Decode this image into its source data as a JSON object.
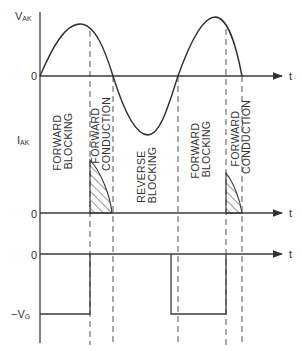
{
  "figure": {
    "panels": [
      {
        "id": "anode-cathode-voltage",
        "y_label_main": "V",
        "y_label_sub": "AK",
        "zero_label": "0",
        "x_label": "t"
      },
      {
        "id": "anode-current",
        "y_label_main": "I",
        "y_label_sub": "AK",
        "zero_label": "0",
        "x_label": "t"
      },
      {
        "id": "gate-voltage",
        "zero_label": "0",
        "level_label_main": "−V",
        "level_label_sub": "G",
        "x_label": "t"
      }
    ],
    "regions": [
      {
        "line1": "FORWARD",
        "line2": "BLOCKING"
      },
      {
        "line1": "FORWARD",
        "line2": "CONDUCTION"
      },
      {
        "line1": "REVERSE",
        "line2": "BLOCKING"
      },
      {
        "line1": "FORWARD",
        "line2": "BLOCKING"
      },
      {
        "line1": "FORWARD",
        "line2": "CONDUCTION"
      }
    ],
    "colors": {
      "line": "#2e2e2e",
      "background": "#ffffff"
    }
  }
}
